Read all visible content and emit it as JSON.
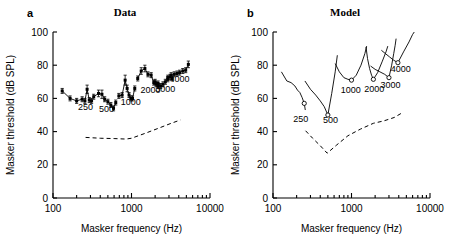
{
  "figure": {
    "xlabel": "Masker frequency (Hz)",
    "ylabel": "Masker threshold (dB SPL)"
  },
  "panels": [
    {
      "letter": "a",
      "title": "Data"
    },
    {
      "letter": "b",
      "title": "Model"
    }
  ],
  "axes": {
    "x_ticks": [
      "100",
      "1000",
      "10000"
    ],
    "y_ticks": [
      "0",
      "20",
      "40",
      "60",
      "80",
      "100"
    ],
    "xlim": [
      100,
      10000
    ],
    "ylim": [
      0,
      100
    ],
    "xscale": "log"
  },
  "curve_labels": [
    "250",
    "500",
    "1000",
    "2000",
    "3000",
    "4000"
  ],
  "chart_data": [
    {
      "type": "line",
      "panel": "a",
      "title": "Data",
      "xlabel": "Masker frequency (Hz)",
      "ylabel": "Masker threshold (dB SPL)",
      "xscale": "log",
      "xlim": [
        100,
        10000
      ],
      "ylim": [
        0,
        100
      ],
      "grid": false,
      "legend": "none",
      "marker": "filled-square",
      "errorbars": true,
      "series": [
        {
          "name": "250",
          "label": "250",
          "label_x": 260,
          "label_y": 53,
          "points": [
            {
              "x": 131,
              "y": 64.5,
              "err": 1.5
            },
            {
              "x": 165,
              "y": 60.0,
              "err": 1.5
            },
            {
              "x": 200,
              "y": 58.5,
              "err": 1.5
            },
            {
              "x": 235,
              "y": 59.5,
              "err": 1.5
            },
            {
              "x": 255,
              "y": 58.5,
              "err": 1.5
            },
            {
              "x": 272,
              "y": 65.5,
              "err": 2.5
            },
            {
              "x": 290,
              "y": 59.0,
              "err": 1.5
            },
            {
              "x": 310,
              "y": 58.5,
              "err": 1.5
            }
          ]
        },
        {
          "name": "500",
          "label": "500",
          "label_x": 480,
          "label_y": 52,
          "points": [
            {
              "x": 330,
              "y": 61.0,
              "err": 1.5
            },
            {
              "x": 380,
              "y": 63.0,
              "err": 2.0
            },
            {
              "x": 420,
              "y": 62.5,
              "err": 2.5
            },
            {
              "x": 455,
              "y": 59.5,
              "err": 1.5
            },
            {
              "x": 500,
              "y": 58.0,
              "err": 1.5
            },
            {
              "x": 545,
              "y": 56.0,
              "err": 1.5
            },
            {
              "x": 590,
              "y": 54.0,
              "err": 1.5
            },
            {
              "x": 630,
              "y": 57.5,
              "err": 1.5
            }
          ]
        },
        {
          "name": "1000",
          "label": "1000",
          "label_x": 980,
          "label_y": 56,
          "points": [
            {
              "x": 690,
              "y": 61.5,
              "err": 1.5
            },
            {
              "x": 760,
              "y": 62.0,
              "err": 1.5
            },
            {
              "x": 830,
              "y": 71.0,
              "err": 3.0
            },
            {
              "x": 880,
              "y": 66.0,
              "err": 2.0
            },
            {
              "x": 930,
              "y": 62.0,
              "err": 1.5
            },
            {
              "x": 980,
              "y": 60.0,
              "err": 1.5
            },
            {
              "x": 1030,
              "y": 60.0,
              "err": 1.5
            },
            {
              "x": 1100,
              "y": 66.0,
              "err": 1.5
            }
          ]
        },
        {
          "name": "2000",
          "label": "2000",
          "label_x": 1750,
          "label_y": 63,
          "points": [
            {
              "x": 1200,
              "y": 72.0,
              "err": 1.5
            },
            {
              "x": 1330,
              "y": 76.5,
              "err": 2.0
            },
            {
              "x": 1480,
              "y": 78.0,
              "err": 2.0
            },
            {
              "x": 1620,
              "y": 74.5,
              "err": 1.5
            },
            {
              "x": 1780,
              "y": 74.0,
              "err": 1.5
            },
            {
              "x": 1920,
              "y": 69.5,
              "err": 1.5
            },
            {
              "x": 2050,
              "y": 68.5,
              "err": 1.5
            },
            {
              "x": 2180,
              "y": 67.5,
              "err": 1.5
            }
          ]
        },
        {
          "name": "3000",
          "label": "3000",
          "label_x": 2700,
          "label_y": 64,
          "points": [
            {
              "x": 2000,
              "y": 70.0,
              "err": 1.5
            },
            {
              "x": 2180,
              "y": 69.0,
              "err": 1.5
            },
            {
              "x": 2350,
              "y": 67.5,
              "err": 1.5
            },
            {
              "x": 2520,
              "y": 68.5,
              "err": 1.5
            },
            {
              "x": 2700,
              "y": 70.0,
              "err": 1.5
            },
            {
              "x": 2900,
              "y": 71.5,
              "err": 1.5
            },
            {
              "x": 3100,
              "y": 73.0,
              "err": 1.5
            },
            {
              "x": 3300,
              "y": 72.0,
              "err": 1.5
            }
          ]
        },
        {
          "name": "4000",
          "label": "4000",
          "label_x": 4100,
          "label_y": 70,
          "points": [
            {
              "x": 2900,
              "y": 72.5,
              "err": 1.5
            },
            {
              "x": 3200,
              "y": 74.0,
              "err": 1.5
            },
            {
              "x": 3500,
              "y": 74.5,
              "err": 1.5
            },
            {
              "x": 3800,
              "y": 75.0,
              "err": 1.5
            },
            {
              "x": 4100,
              "y": 75.5,
              "err": 1.5
            },
            {
              "x": 4500,
              "y": 76.5,
              "err": 1.5
            },
            {
              "x": 4900,
              "y": 77.0,
              "err": 1.5
            },
            {
              "x": 5300,
              "y": 80.5,
              "err": 2.0
            }
          ]
        }
      ],
      "absolute_threshold": {
        "name": "absolute threshold",
        "style": "dashed",
        "points": [
          {
            "x": 260,
            "y": 36.5
          },
          {
            "x": 400,
            "y": 36.0
          },
          {
            "x": 600,
            "y": 35.8
          },
          {
            "x": 850,
            "y": 35.5
          },
          {
            "x": 1000,
            "y": 36.0
          },
          {
            "x": 1500,
            "y": 39.0
          },
          {
            "x": 2200,
            "y": 42.0
          },
          {
            "x": 3200,
            "y": 45.0
          },
          {
            "x": 4200,
            "y": 47.0
          }
        ]
      }
    },
    {
      "type": "line",
      "panel": "b",
      "title": "Model",
      "xlabel": "Masker frequency (Hz)",
      "ylabel": "Masker threshold (dB SPL)",
      "xscale": "log",
      "xlim": [
        100,
        10000
      ],
      "ylim": [
        0,
        100
      ],
      "grid": false,
      "legend": "none",
      "marker": "open-circle-at-tip",
      "errorbars": false,
      "series": [
        {
          "name": "250",
          "label": "250",
          "label_x": 225,
          "label_y": 46,
          "tip": {
            "x": 250,
            "y": 57
          },
          "points": [
            {
              "x": 128,
              "y": 76.0
            },
            {
              "x": 150,
              "y": 70.5
            },
            {
              "x": 170,
              "y": 69.5
            },
            {
              "x": 190,
              "y": 67.5
            },
            {
              "x": 205,
              "y": 65.0
            },
            {
              "x": 220,
              "y": 63.5
            },
            {
              "x": 235,
              "y": 60.5
            },
            {
              "x": 250,
              "y": 57.0
            },
            {
              "x": 258,
              "y": 53.0
            }
          ]
        },
        {
          "name": "500",
          "label": "500",
          "label_x": 540,
          "label_y": 45,
          "tip": {
            "x": 500,
            "y": 50
          },
          "points": [
            {
              "x": 255,
              "y": 70.5
            },
            {
              "x": 300,
              "y": 65.5
            },
            {
              "x": 350,
              "y": 62.0
            },
            {
              "x": 400,
              "y": 58.5
            },
            {
              "x": 450,
              "y": 55.0
            },
            {
              "x": 500,
              "y": 50.0
            },
            {
              "x": 560,
              "y": 63.0
            },
            {
              "x": 620,
              "y": 76.0
            },
            {
              "x": 660,
              "y": 86.0
            }
          ]
        },
        {
          "name": "1000",
          "label": "1000",
          "label_x": 980,
          "label_y": 63,
          "tip": {
            "x": 1000,
            "y": 71
          },
          "points": [
            {
              "x": 620,
              "y": 81.0
            },
            {
              "x": 700,
              "y": 76.0
            },
            {
              "x": 800,
              "y": 72.5
            },
            {
              "x": 900,
              "y": 71.5
            },
            {
              "x": 1000,
              "y": 71.0
            },
            {
              "x": 1150,
              "y": 74.0
            },
            {
              "x": 1320,
              "y": 80.0
            },
            {
              "x": 1480,
              "y": 87.0
            },
            {
              "x": 1560,
              "y": 91.5
            }
          ]
        },
        {
          "name": "2000",
          "label": "2000",
          "label_x": 1950,
          "label_y": 64,
          "tip": {
            "x": 1900,
            "y": 71.5
          },
          "points": [
            {
              "x": 1530,
              "y": 91.0
            },
            {
              "x": 1600,
              "y": 84.0
            },
            {
              "x": 1700,
              "y": 78.0
            },
            {
              "x": 1800,
              "y": 74.0
            },
            {
              "x": 1900,
              "y": 71.5
            },
            {
              "x": 2150,
              "y": 75.5
            },
            {
              "x": 2450,
              "y": 82.0
            },
            {
              "x": 2750,
              "y": 88.0
            },
            {
              "x": 2900,
              "y": 91.5
            }
          ]
        },
        {
          "name": "3000",
          "label": "3000",
          "label_x": 3150,
          "label_y": 66,
          "tip": {
            "x": 3000,
            "y": 72.5
          },
          "points": [
            {
              "x": 1750,
              "y": 79.5
            },
            {
              "x": 2000,
              "y": 77.5
            },
            {
              "x": 2300,
              "y": 76.0
            },
            {
              "x": 2650,
              "y": 74.5
            },
            {
              "x": 3000,
              "y": 72.5
            },
            {
              "x": 3250,
              "y": 80.0
            },
            {
              "x": 3450,
              "y": 87.0
            },
            {
              "x": 3600,
              "y": 92.0
            },
            {
              "x": 3700,
              "y": 96.0
            }
          ]
        },
        {
          "name": "4000",
          "label": "4000",
          "label_x": 4250,
          "label_y": 76,
          "tip": {
            "x": 3900,
            "y": 81.5
          },
          "points": [
            {
              "x": 2400,
              "y": 89.0
            },
            {
              "x": 2700,
              "y": 87.0
            },
            {
              "x": 3050,
              "y": 85.0
            },
            {
              "x": 3450,
              "y": 83.0
            },
            {
              "x": 3900,
              "y": 81.5
            },
            {
              "x": 4600,
              "y": 88.0
            },
            {
              "x": 5400,
              "y": 94.0
            },
            {
              "x": 6000,
              "y": 98.5
            },
            {
              "x": 6300,
              "y": 100.0
            }
          ]
        }
      ],
      "absolute_threshold": {
        "name": "absolute threshold",
        "style": "dashed",
        "points": [
          {
            "x": 260,
            "y": 40.5
          },
          {
            "x": 320,
            "y": 36.0
          },
          {
            "x": 400,
            "y": 31.5
          },
          {
            "x": 490,
            "y": 27.0
          },
          {
            "x": 650,
            "y": 32.0
          },
          {
            "x": 900,
            "y": 37.5
          },
          {
            "x": 1300,
            "y": 41.5
          },
          {
            "x": 1900,
            "y": 45.0
          },
          {
            "x": 2600,
            "y": 46.5
          },
          {
            "x": 3500,
            "y": 48.5
          },
          {
            "x": 4300,
            "y": 51.0
          }
        ]
      }
    }
  ]
}
